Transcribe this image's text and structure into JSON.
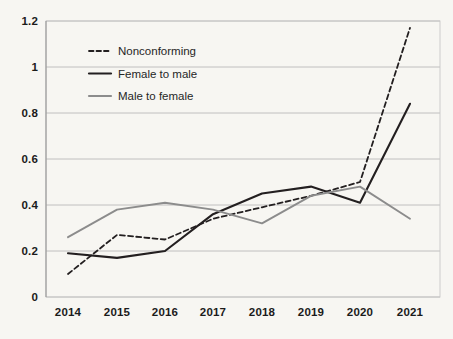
{
  "chart_data": {
    "type": "line",
    "title": "",
    "subtitle": "",
    "xlabel": "",
    "ylabel": "",
    "categories": [
      "2014",
      "2015",
      "2016",
      "2017",
      "2018",
      "2019",
      "2020",
      "2021"
    ],
    "x": [
      2014,
      2015,
      2016,
      2017,
      2018,
      2019,
      2020,
      2021
    ],
    "ylim": [
      0,
      1.2
    ],
    "yticks": [
      0,
      0.2,
      0.4,
      0.6,
      0.8,
      1,
      1.2
    ],
    "ytick_labels": [
      "0",
      "0.2",
      "0.4",
      "0.6",
      "0.8",
      "1",
      "1.2"
    ],
    "grid": true,
    "legend_position": "upper-left-inside",
    "series": [
      {
        "name": "Nonconforming",
        "style": "dashed",
        "color": "#231f20",
        "values": [
          0.1,
          0.27,
          0.25,
          0.34,
          0.39,
          0.44,
          0.5,
          1.17
        ]
      },
      {
        "name": "Female to male",
        "style": "solid",
        "color": "#231f20",
        "values": [
          0.19,
          0.17,
          0.2,
          0.36,
          0.45,
          0.48,
          0.41,
          0.84
        ]
      },
      {
        "name": "Male to female",
        "style": "solid",
        "color": "#8c8c8c",
        "values": [
          0.26,
          0.38,
          0.41,
          0.38,
          0.32,
          0.44,
          0.48,
          0.34
        ]
      }
    ]
  },
  "legend": {
    "items": [
      {
        "label": "Nonconforming"
      },
      {
        "label": "Female to male"
      },
      {
        "label": "Male to female"
      }
    ]
  },
  "axes": {
    "y_labels": [
      "1.2",
      "1",
      "0.8",
      "0.6",
      "0.4",
      "0.2",
      "0"
    ],
    "x_labels": [
      "2014",
      "2015",
      "2016",
      "2017",
      "2018",
      "2019",
      "2020",
      "2021"
    ]
  },
  "colors": {
    "background": "#f7f6f2",
    "gridline": "#b9b9b9",
    "dark_series": "#231f20",
    "gray_series": "#8c8c8c",
    "text": "#1b1b1b"
  }
}
